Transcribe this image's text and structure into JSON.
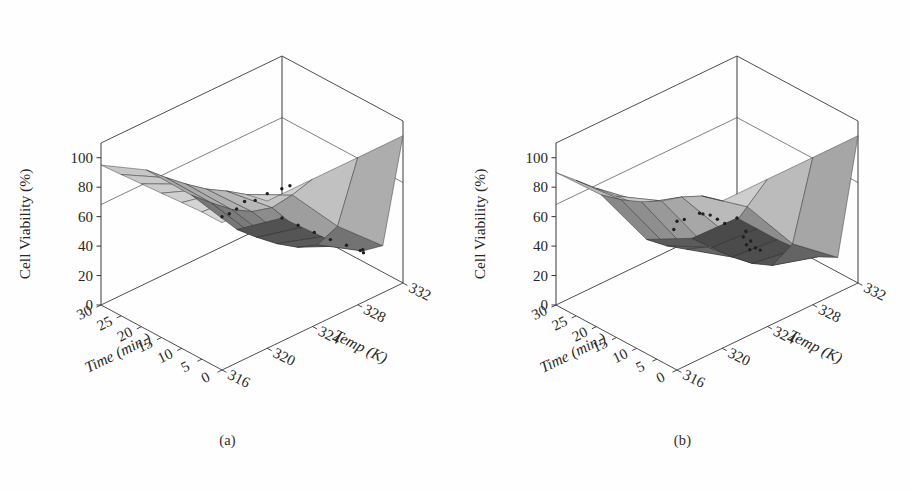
{
  "figure": {
    "background": "#fefefe",
    "panels": [
      {
        "caption": "(a)"
      },
      {
        "caption": "(b)"
      }
    ]
  },
  "chart_data": [
    {
      "type": "surface",
      "panel": "(a)",
      "title": "",
      "xlabel": "Time (min.)",
      "ylabel": "Temp (K)",
      "zlabel": "Cell Viability (%)",
      "xticks": [
        30,
        25,
        20,
        15,
        10,
        5,
        0
      ],
      "yticks": [
        316,
        320,
        324,
        328,
        332
      ],
      "zticks": [
        0,
        20,
        40,
        60,
        80,
        100
      ],
      "xlim": [
        30,
        0
      ],
      "ylim": [
        316,
        332
      ],
      "zlim": [
        0,
        110
      ],
      "grid": true,
      "legend": "none",
      "surface_colormap": "grayscale",
      "surface_color_low": "#4a4a4a",
      "surface_color_high": "#d8d8d8",
      "mesh_line_color": "#2a2a2a",
      "scatter_point_color": "#1f1f1f",
      "x": [
        0,
        5,
        10,
        15,
        20,
        25,
        30
      ],
      "y": [
        316,
        320,
        324,
        328,
        332
      ],
      "z": [
        [
          100,
          100,
          99,
          98,
          97,
          96,
          95
        ],
        [
          100,
          97,
          92,
          86,
          82,
          79,
          77
        ],
        [
          100,
          82,
          66,
          56,
          50,
          47,
          45
        ],
        [
          100,
          46,
          26,
          17,
          12,
          9,
          7
        ],
        [
          100,
          18,
          7,
          3,
          2,
          1,
          0
        ]
      ],
      "scatter": [
        {
          "x": 0,
          "y": 316,
          "z": 104
        },
        {
          "x": 0,
          "y": 318,
          "z": 107
        },
        {
          "x": 0,
          "y": 320,
          "z": 105
        },
        {
          "x": 0,
          "y": 322,
          "z": 103
        },
        {
          "x": 1,
          "y": 317,
          "z": 101
        },
        {
          "x": 2,
          "y": 318,
          "z": 99
        },
        {
          "x": 2,
          "y": 322,
          "z": 98
        },
        {
          "x": 3,
          "y": 320,
          "z": 96
        },
        {
          "x": 5,
          "y": 330,
          "z": 22
        },
        {
          "x": 7,
          "y": 331,
          "z": 14
        },
        {
          "x": 10,
          "y": 332,
          "z": 8
        },
        {
          "x": 14,
          "y": 332,
          "z": 5
        },
        {
          "x": 18,
          "y": 332,
          "z": 3
        },
        {
          "x": 22,
          "y": 332,
          "z": 2
        },
        {
          "x": 26,
          "y": 332,
          "z": 1
        },
        {
          "x": 30,
          "y": 332,
          "z": 0
        }
      ],
      "notes": "Cell viability decreases with both longer exposure time and higher temperature; sharp drop-off above 324 K."
    },
    {
      "type": "surface",
      "panel": "(b)",
      "title": "",
      "xlabel": "Time (min.)",
      "ylabel": "Temp (K)",
      "zlabel": "Cell Viability (%)",
      "xticks": [
        30,
        25,
        20,
        15,
        10,
        5,
        0
      ],
      "yticks": [
        316,
        320,
        324,
        328,
        332
      ],
      "zticks": [
        0,
        20,
        40,
        60,
        80,
        100
      ],
      "xlim": [
        30,
        0
      ],
      "ylim": [
        316,
        332
      ],
      "zlim": [
        0,
        110
      ],
      "grid": true,
      "legend": "none",
      "surface_colormap": "grayscale",
      "surface_color_low": "#4a4a4a",
      "surface_color_high": "#d8d8d8",
      "mesh_line_color": "#2a2a2a",
      "scatter_point_color": "#1f1f1f",
      "x": [
        0,
        5,
        10,
        15,
        20,
        25,
        30
      ],
      "y": [
        316,
        320,
        324,
        328,
        332
      ],
      "z": [
        [
          100,
          99,
          98,
          96,
          94,
          92,
          90
        ],
        [
          100,
          96,
          88,
          78,
          70,
          64,
          60
        ],
        [
          100,
          74,
          48,
          32,
          23,
          18,
          15
        ],
        [
          100,
          34,
          12,
          6,
          3,
          2,
          1
        ],
        [
          100,
          10,
          3,
          1,
          0,
          0,
          0
        ]
      ],
      "scatter": [
        {
          "x": 0,
          "y": 316,
          "z": 101
        },
        {
          "x": 0,
          "y": 318,
          "z": 99
        },
        {
          "x": 1,
          "y": 317,
          "z": 97
        },
        {
          "x": 2,
          "y": 319,
          "z": 92
        },
        {
          "x": 3,
          "y": 320,
          "z": 86
        },
        {
          "x": 4,
          "y": 321,
          "z": 78
        },
        {
          "x": 5,
          "y": 322,
          "z": 70
        },
        {
          "x": 12,
          "y": 320,
          "z": 63
        },
        {
          "x": 6,
          "y": 324,
          "z": 52
        },
        {
          "x": 8,
          "y": 325,
          "z": 40
        },
        {
          "x": 10,
          "y": 326,
          "z": 30
        },
        {
          "x": 13,
          "y": 328,
          "z": 18
        },
        {
          "x": 17,
          "y": 329,
          "z": 10
        },
        {
          "x": 21,
          "y": 330,
          "z": 5
        },
        {
          "x": 25,
          "y": 331,
          "z": 2
        },
        {
          "x": 30,
          "y": 332,
          "z": 0
        }
      ],
      "notes": "Steeper sigmoidal decline than panel (a): viability collapses to near zero beyond 326 K for most exposure times."
    }
  ]
}
